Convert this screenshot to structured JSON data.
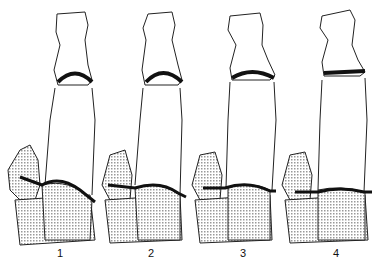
{
  "figure": {
    "panels": [
      {
        "label": "1",
        "cx": 75,
        "label_x": 60
      },
      {
        "label": "2",
        "cx": 165,
        "label_x": 151
      },
      {
        "label": "3",
        "cx": 260,
        "label_x": 243
      },
      {
        "label": "4",
        "cx": 345,
        "label_x": 336
      }
    ],
    "colors": {
      "line": "#111111",
      "stipple": "#bbbbbb",
      "background": "#ffffff"
    }
  }
}
